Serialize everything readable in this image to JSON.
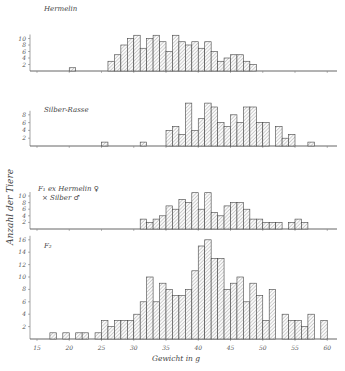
{
  "chart_data": {
    "type": "bar",
    "ylabel": "Anzahl der Tiere",
    "xlabel": "Gewicht in g",
    "x_ticks": [
      15,
      20,
      25,
      30,
      35,
      40,
      45,
      50,
      55,
      60
    ],
    "xlim": [
      15,
      61
    ],
    "grid": false,
    "panels": [
      {
        "name": "Hermelin",
        "yticks": [
          2,
          4,
          6,
          8,
          10
        ],
        "bins": [
          20,
          26,
          27,
          28,
          29,
          30,
          31,
          32,
          33,
          34,
          35,
          36,
          37,
          38,
          39,
          40,
          41,
          42,
          43,
          44,
          45,
          46,
          47,
          48
        ],
        "values": [
          1,
          3,
          5,
          8,
          10,
          11,
          7,
          10,
          11,
          9,
          6,
          11,
          9,
          8,
          9,
          7,
          9,
          6,
          3,
          4,
          5,
          5,
          3,
          2
        ]
      },
      {
        "name": "Silber-Rasse",
        "yticks": [
          2,
          4,
          6,
          8
        ],
        "bins": [
          25,
          31,
          35,
          36,
          37,
          38,
          39,
          40,
          41,
          42,
          43,
          44,
          45,
          46,
          47,
          48,
          49,
          50,
          52,
          53,
          54,
          57
        ],
        "values": [
          1,
          1,
          4,
          5,
          3,
          11,
          4,
          7,
          11,
          10,
          6,
          5,
          8,
          6,
          10,
          10,
          6,
          6,
          5,
          2,
          3,
          1
        ]
      },
      {
        "name": "F1 ex Hermelin ♀ × Silber ♂",
        "label_line1": "F₁ ex Hermelin ♀",
        "label_line2": "× Silber   ♂",
        "yticks": [
          2,
          4,
          6,
          8,
          10
        ],
        "bins": [
          31,
          32,
          33,
          34,
          35,
          36,
          37,
          38,
          39,
          40,
          41,
          42,
          43,
          44,
          45,
          46,
          47,
          48,
          49,
          50,
          51,
          52,
          54,
          55,
          56
        ],
        "values": [
          3,
          2,
          3,
          4,
          7,
          6,
          9,
          8,
          11,
          6,
          11,
          5,
          4,
          7,
          8,
          8,
          6,
          3,
          3,
          2,
          2,
          2,
          2,
          3,
          2
        ]
      },
      {
        "name": "F2",
        "yticks": [
          2,
          4,
          6,
          8,
          10,
          12,
          14,
          16
        ],
        "bins": [
          17,
          19,
          21,
          22,
          24,
          25,
          26,
          27,
          28,
          29,
          30,
          31,
          32,
          33,
          34,
          35,
          36,
          37,
          38,
          39,
          40,
          41,
          42,
          43,
          44,
          45,
          46,
          47,
          48,
          49,
          50,
          51,
          53,
          54,
          55,
          56,
          57,
          59
        ],
        "values": [
          1,
          1,
          1,
          1,
          1,
          3,
          2,
          3,
          3,
          3,
          4,
          6,
          10,
          6,
          9,
          8,
          7,
          7,
          8,
          11,
          15,
          16,
          13,
          13,
          8,
          9,
          10,
          6,
          9,
          7,
          3,
          8,
          4,
          3,
          3,
          2,
          4,
          3
        ]
      }
    ]
  },
  "labels": {
    "ylabel": "Anzahl der Tiere",
    "xlabel": "Gewicht in g",
    "p0": "Hermelin",
    "p1": "Silber-Rasse",
    "p2a": "F₁ ex Hermelin ♀",
    "p2b": "× Silber   ♂",
    "p3": "F₂"
  }
}
